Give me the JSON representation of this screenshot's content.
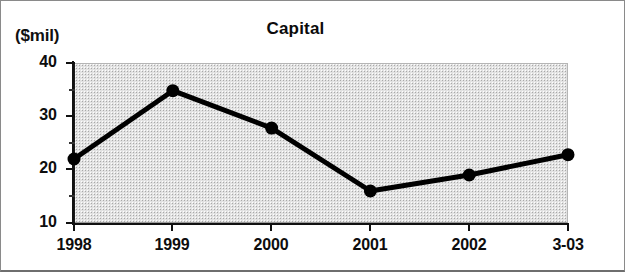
{
  "figure": {
    "background": "#ffffff",
    "border_color": "#8a8a8a",
    "plot_fill": "#e2e2e2"
  },
  "chart_data": {
    "type": "line",
    "title": "Capital",
    "ylabel": "($mil)",
    "xlabel": "",
    "categories": [
      "1998",
      "1999",
      "2000",
      "2001",
      "2002",
      "3-03"
    ],
    "values": [
      22.0,
      34.8,
      27.8,
      16.0,
      19.0,
      22.8
    ],
    "series": [
      {
        "name": "Capital",
        "values": [
          22.0,
          34.8,
          27.8,
          16.0,
          19.0,
          22.8
        ],
        "color": "#000000",
        "marker": "circle",
        "line_width_px": 5,
        "marker_size_px": 13
      }
    ],
    "ylim": [
      10,
      40
    ],
    "yticks": [
      10,
      20,
      30,
      40
    ],
    "ytick_labels": [
      "10",
      "20",
      "30",
      "40"
    ],
    "yminor_ticks": [
      15,
      25,
      35
    ],
    "grid": false,
    "legend": false,
    "legend_position": "none"
  }
}
